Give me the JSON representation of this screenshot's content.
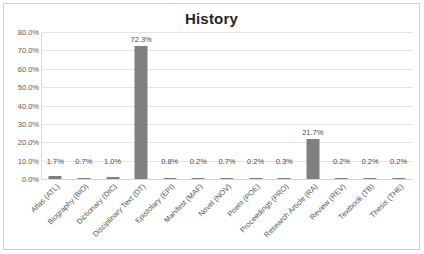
{
  "chart_data": {
    "type": "bar",
    "title": "History",
    "xlabel": "",
    "ylabel": "",
    "ylim": [
      0,
      80
    ],
    "grid": true,
    "legend": "none",
    "y_ticks": [
      "0.0%",
      "10.0%",
      "20.0%",
      "30.0%",
      "40.0%",
      "50.0%",
      "60.0%",
      "70.0%",
      "80.0%"
    ],
    "y_tick_values": [
      0,
      10,
      20,
      30,
      40,
      50,
      60,
      70,
      80
    ],
    "categories": [
      "Atlas (ATL)",
      "Biography (BIO)",
      "Dictionary (DIC)",
      "Disciplinary Text (DT)",
      "Epistolary (EPI)",
      "Manifest (MAF)",
      "Novel (NOV)",
      "Poem (POE)",
      "Proceedings (PRO)",
      "Research Article (RA)",
      "Review (REV)",
      "Textbook (TB)",
      "Thesis (THE)"
    ],
    "values": [
      1.7,
      0.7,
      1.0,
      72.3,
      0.8,
      0.2,
      0.7,
      0.2,
      0.3,
      21.7,
      0.2,
      0.2,
      0.2
    ],
    "data_labels": [
      "1.7%",
      "0.7%",
      "1.0%",
      "72.3%",
      "0.8%",
      "0.2%",
      "0.7%",
      "0.2%",
      "0.3%",
      "21.7%",
      "0.2%",
      "0.2%",
      "0.2%"
    ],
    "bar_color": "#808080",
    "gridline_color": "#e4e4e4",
    "title_color": "#262626",
    "label_color": "#4a4a4a"
  }
}
